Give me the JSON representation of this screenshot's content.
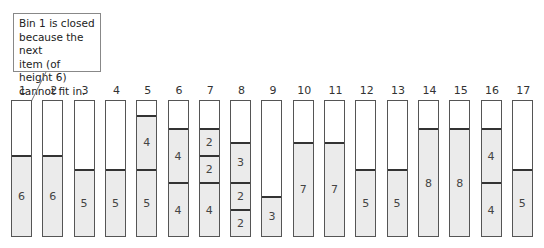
{
  "callout": {
    "lines": [
      "Bin 1 is closed",
      "because the next",
      "item (of height 6)",
      "cannot fit in."
    ]
  },
  "bin_capacity": 10,
  "colors": {
    "item_fill": "#ebebeb",
    "border": "#555555",
    "divider": "#333333"
  },
  "bins": [
    {
      "label": "1",
      "items": [
        6
      ]
    },
    {
      "label": "2",
      "items": [
        6
      ]
    },
    {
      "label": "3",
      "items": [
        5
      ]
    },
    {
      "label": "4",
      "items": [
        5
      ]
    },
    {
      "label": "5",
      "items": [
        5,
        4
      ]
    },
    {
      "label": "6",
      "items": [
        4,
        4
      ]
    },
    {
      "label": "7",
      "items": [
        4,
        2,
        2
      ]
    },
    {
      "label": "8",
      "items": [
        2,
        2,
        3
      ]
    },
    {
      "label": "9",
      "items": [
        3
      ]
    },
    {
      "label": "10",
      "items": [
        7
      ]
    },
    {
      "label": "11",
      "items": [
        7
      ]
    },
    {
      "label": "12",
      "items": [
        5
      ]
    },
    {
      "label": "13",
      "items": [
        5
      ]
    },
    {
      "label": "14",
      "items": [
        8
      ]
    },
    {
      "label": "15",
      "items": [
        8
      ]
    },
    {
      "label": "16",
      "items": [
        4,
        4
      ]
    },
    {
      "label": "17",
      "items": [
        5
      ]
    }
  ]
}
